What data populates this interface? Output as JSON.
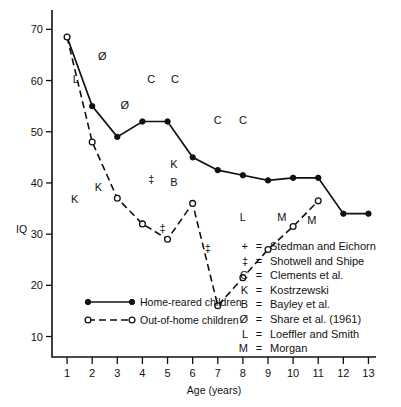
{
  "chart_data": {
    "type": "line",
    "title": "",
    "xlabel": "Age (years)",
    "ylabel": "IQ",
    "xlim": [
      0.4,
      13.3
    ],
    "ylim": [
      6,
      73
    ],
    "grid": false,
    "x_ticks": [
      1,
      2,
      3,
      4,
      5,
      6,
      7,
      8,
      9,
      10,
      11,
      12,
      13
    ],
    "y_ticks": [
      10,
      20,
      30,
      40,
      50,
      60,
      70
    ],
    "legend_position": "lower-left-inside",
    "series": [
      {
        "name": "Home-reared children",
        "marker": "filled-circle",
        "line": "solid",
        "x": [
          1,
          2,
          3,
          4,
          5,
          6,
          7,
          8,
          9,
          10,
          11,
          12,
          13
        ],
        "values": [
          68.5,
          55.0,
          49.0,
          52.0,
          52.0,
          45.0,
          42.5,
          41.5,
          40.5,
          41.0,
          41.0,
          34.0,
          34.0
        ]
      },
      {
        "name": "Out-of-home children",
        "marker": "open-circle",
        "line": "dashed",
        "x": [
          1,
          2,
          3,
          4,
          5,
          6,
          7,
          8,
          9,
          10,
          11
        ],
        "values": [
          68.5,
          48.0,
          37.0,
          32.0,
          29.0,
          36.0,
          16.0,
          21.5,
          27.0,
          31.5,
          36.5
        ]
      }
    ],
    "annotations": [
      {
        "label": "L",
        "x": 1.35,
        "y": 59.5
      },
      {
        "label": "Ø",
        "x": 2.4,
        "y": 64.0
      },
      {
        "label": "Ø",
        "x": 3.3,
        "y": 54.5
      },
      {
        "label": "C",
        "x": 4.35,
        "y": 59.5
      },
      {
        "label": "C",
        "x": 5.3,
        "y": 59.5
      },
      {
        "label": "C",
        "x": 7.0,
        "y": 51.5
      },
      {
        "label": "C",
        "x": 8.0,
        "y": 51.5
      },
      {
        "label": "K",
        "x": 1.3,
        "y": 36.0
      },
      {
        "label": "K",
        "x": 2.25,
        "y": 38.5
      },
      {
        "label": "K",
        "x": 5.25,
        "y": 43.0
      },
      {
        "label": "B",
        "x": 5.25,
        "y": 39.5
      },
      {
        "label": "‡",
        "x": 4.35,
        "y": 40.0
      },
      {
        "label": "‡",
        "x": 4.8,
        "y": 30.5
      },
      {
        "label": "‡",
        "x": 6.6,
        "y": 26.5
      },
      {
        "label": "L",
        "x": 8.0,
        "y": 32.5
      },
      {
        "label": "M",
        "x": 9.55,
        "y": 32.5
      },
      {
        "label": "M",
        "x": 10.75,
        "y": 32.0
      }
    ],
    "key": {
      "title": "",
      "entries": [
        {
          "symbol": "+",
          "name": "Stedman and Eichorn"
        },
        {
          "symbol": "‡",
          "name": "Shotwell and Shipe"
        },
        {
          "symbol": "C",
          "name": "Clements et al."
        },
        {
          "symbol": "K",
          "name": "Kostrzewski"
        },
        {
          "symbol": "B",
          "name": "Bayley et al."
        },
        {
          "symbol": "Ø",
          "name": "Share et al. (1961)"
        },
        {
          "symbol": "L",
          "name": "Loeffler and Smith"
        },
        {
          "symbol": "M",
          "name": "Morgan"
        }
      ],
      "equals": "="
    },
    "colors": {
      "line": "#111111",
      "text": "#111111",
      "background": "#ffffff"
    }
  }
}
